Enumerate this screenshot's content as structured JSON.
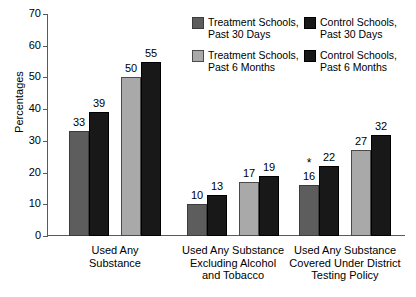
{
  "chart_data": {
    "type": "bar",
    "title": "",
    "xlabel": "",
    "ylabel": "Percentages",
    "ylim": [
      0,
      70
    ],
    "ytick_step": 10,
    "yticks": [
      0,
      10,
      20,
      30,
      40,
      50,
      60,
      70
    ],
    "grid": false,
    "legend_position": "top-right",
    "categories": [
      "Used Any\nSubstance",
      "Used Any Substance\nExcluding Alcohol\nand Tobacco",
      "Used Any Substance\nCovered Under District\nTesting Policy"
    ],
    "series": [
      {
        "name": "Treatment Schools,\nPast 30 Days",
        "color": "#5d5d5d",
        "values": [
          33,
          10,
          16
        ],
        "annotations": [
          "",
          "",
          "*"
        ]
      },
      {
        "name": "Control Schools,\nPast 30 Days",
        "color": "#181818",
        "values": [
          39,
          13,
          22
        ],
        "annotations": [
          "",
          "",
          ""
        ]
      },
      {
        "name": "Treatment Schools,\nPast 6 Months",
        "color": "#a9a9a9",
        "values": [
          50,
          17,
          27
        ],
        "annotations": [
          "",
          "",
          ""
        ]
      },
      {
        "name": "Control Schools,\nPast 6 Months",
        "color": "#181818",
        "values": [
          55,
          19,
          32
        ],
        "annotations": [
          "",
          "",
          ""
        ]
      }
    ]
  },
  "legend": {
    "items": [
      {
        "label": "Treatment Schools,\nPast 30 Days",
        "series": 0
      },
      {
        "label": "Control Schools,\nPast 30 Days",
        "series": 1
      },
      {
        "label": "Treatment Schools,\nPast 6 Months",
        "series": 2
      },
      {
        "label": "Control Schools,\nPast 6 Months",
        "series": 3
      }
    ]
  }
}
